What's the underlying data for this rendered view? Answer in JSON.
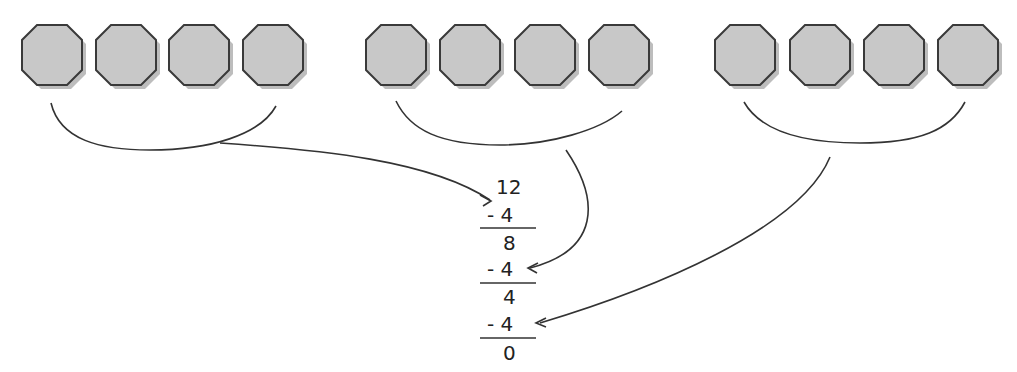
{
  "diagram": {
    "groups": [
      {
        "id": "group-1",
        "count": 4
      },
      {
        "id": "group-2",
        "count": 4
      },
      {
        "id": "group-3",
        "count": 4
      }
    ],
    "subtraction": {
      "start": "12",
      "steps": [
        {
          "op": "- 4",
          "result": "8"
        },
        {
          "op": "- 4",
          "result": "4"
        },
        {
          "op": "- 4",
          "result": "0"
        }
      ]
    },
    "colors": {
      "octagon_fill": "#c8c8c8",
      "octagon_stroke": "#3a3a3a",
      "shadow": "#b0b0b0",
      "line": "#333333"
    }
  }
}
